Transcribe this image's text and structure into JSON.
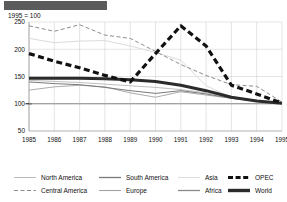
{
  "title_bar": {
    "text": ""
  },
  "index_note": "1995 = 100",
  "legend": {
    "items": [
      {
        "label": "North America",
        "key": "north_america",
        "style": "thin-solid",
        "color": "#b9b9b9",
        "icon": "line-swatch-icon"
      },
      {
        "label": "Central America",
        "key": "central_america",
        "style": "thin-dashed",
        "color": "#8d8d8d",
        "icon": "dashed-line-swatch-icon"
      },
      {
        "label": "South America",
        "key": "south_america",
        "style": "thin-solid",
        "color": "#7a7a7a",
        "icon": "line-swatch-icon"
      },
      {
        "label": "Europe",
        "key": "europe",
        "style": "thin-solid",
        "color": "#a2a2a2",
        "icon": "line-swatch-icon"
      },
      {
        "label": "Asia",
        "key": "asia",
        "style": "thin-solid",
        "color": "#dcdcdc",
        "icon": "line-swatch-icon"
      },
      {
        "label": "Africa",
        "key": "africa",
        "style": "thin-solid",
        "color": "#8a8a8a",
        "icon": "line-swatch-icon"
      },
      {
        "label": "OPEC",
        "key": "opec",
        "style": "thick-dashed",
        "color": "#111111",
        "icon": "bold-dashed-line-swatch-icon"
      },
      {
        "label": "World",
        "key": "world",
        "style": "thick-solid",
        "color": "#2b2b2b",
        "icon": "bold-line-swatch-icon"
      }
    ]
  },
  "chart_data": {
    "type": "line",
    "title": "",
    "subtitle": "1995 = 100",
    "xlabel": "",
    "ylabel": "",
    "x": [
      1985,
      1986,
      1987,
      1988,
      1989,
      1990,
      1991,
      1992,
      1993,
      1994,
      1995
    ],
    "xtick_labels": [
      "1985",
      "1986",
      "1987",
      "1988",
      "1989",
      "1990",
      "1991",
      "1992",
      "1993",
      "1994",
      "1995"
    ],
    "xlim": [
      1985,
      1995
    ],
    "ylim": [
      50,
      250
    ],
    "ytick_labels": [
      "50",
      "100",
      "150",
      "200",
      "250"
    ],
    "yticks": [
      50,
      100,
      150,
      200,
      250
    ],
    "grid": true,
    "legend_position": "bottom",
    "series": [
      {
        "name": "North America",
        "color": "#b9b9b9",
        "width": 0.9,
        "dash": "none",
        "values": [
          143,
          141,
          139,
          136,
          133,
          130,
          126,
          120,
          112,
          106,
          101
        ]
      },
      {
        "name": "Central America",
        "color": "#8d8d8d",
        "width": 1.0,
        "dash": "4,2.5",
        "values": [
          243,
          233,
          245,
          226,
          220,
          196,
          172,
          152,
          135,
          132,
          103
        ]
      },
      {
        "name": "South America",
        "color": "#7a7a7a",
        "width": 1.0,
        "dash": "none",
        "values": [
          140,
          137,
          135,
          130,
          124,
          119,
          124,
          118,
          110,
          105,
          101
        ]
      },
      {
        "name": "Europe",
        "color": "#a2a2a2",
        "width": 0.9,
        "dash": "none",
        "values": [
          125,
          131,
          134,
          131,
          120,
          112,
          122,
          116,
          110,
          105,
          101
        ]
      },
      {
        "name": "Asia",
        "color": "#dcdcdc",
        "width": 1.0,
        "dash": "none",
        "values": [
          220,
          212,
          215,
          216,
          206,
          194,
          180,
          133,
          112,
          106,
          101
        ]
      },
      {
        "name": "Africa",
        "color": "#8a8a8a",
        "width": 1.0,
        "dash": "none",
        "values": [
          100,
          100,
          100,
          100,
          100,
          100,
          100,
          100,
          100,
          100,
          100
        ]
      },
      {
        "name": "OPEC",
        "color": "#111111",
        "width": 3.2,
        "dash": "6,3.5",
        "values": [
          192,
          178,
          166,
          152,
          140,
          192,
          243,
          206,
          134,
          118,
          101
        ]
      },
      {
        "name": "World",
        "color": "#2b2b2b",
        "width": 3.0,
        "dash": "none",
        "values": [
          147,
          147,
          147,
          146,
          144,
          141,
          134,
          124,
          112,
          105,
          101
        ]
      }
    ]
  }
}
